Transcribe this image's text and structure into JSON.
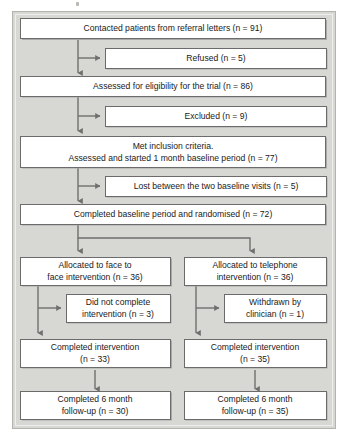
{
  "diagram": {
    "panel": {
      "background_color": "#d7d7d4",
      "border_color": "#b3b3b0"
    },
    "box_style": {
      "fill": "#ffffff",
      "border_color": "#6b6b6b",
      "shadow_color": "#a9a9a7"
    },
    "connector_color": "#6f6f6f",
    "nodes": [
      {
        "id": "contacted",
        "name": "contacted-patients-box",
        "lines": [
          "Contacted patients from referral letters (n = 91)"
        ],
        "n": 91,
        "column": "full"
      },
      {
        "id": "refused",
        "name": "refused-box",
        "lines": [
          "Refused (n = 5)"
        ],
        "n": 5,
        "column": "right-branch"
      },
      {
        "id": "assessed",
        "name": "assessed-eligibility-box",
        "lines": [
          "Assessed for eligibility for the trial (n = 86)"
        ],
        "n": 86,
        "column": "full"
      },
      {
        "id": "excluded",
        "name": "excluded-box",
        "lines": [
          "Excluded (n = 9)"
        ],
        "n": 9,
        "column": "right-branch"
      },
      {
        "id": "met-inclusion",
        "name": "met-inclusion-criteria-box",
        "lines": [
          "Met inclusion criteria.",
          "Assessed and started 1 month baseline period (n = 77)"
        ],
        "n": 77,
        "column": "full"
      },
      {
        "id": "lost-baseline",
        "name": "lost-between-baseline-visits-box",
        "lines": [
          "Lost between the two baseline visits (n = 5)"
        ],
        "n": 5,
        "column": "right-branch"
      },
      {
        "id": "randomised",
        "name": "completed-baseline-randomised-box",
        "lines": [
          "Completed baseline period and randomised (n = 72)"
        ],
        "n": 72,
        "column": "full"
      },
      {
        "id": "alloc-face",
        "name": "allocated-face-to-face-box",
        "lines": [
          "Allocated to face to",
          "face intervention (n = 36)"
        ],
        "n": 36,
        "column": "left"
      },
      {
        "id": "alloc-phone",
        "name": "allocated-telephone-box",
        "lines": [
          "Allocated to telephone",
          "intervention (n = 36)"
        ],
        "n": 36,
        "column": "right"
      },
      {
        "id": "did-not-complete",
        "name": "did-not-complete-intervention-box",
        "lines": [
          "Did not complete",
          "intervention (n = 3)"
        ],
        "n": 3,
        "column": "left-branch"
      },
      {
        "id": "withdrawn",
        "name": "withdrawn-by-clinician-box",
        "lines": [
          "Withdrawn by",
          "clinician (n = 1)"
        ],
        "n": 1,
        "column": "right-branch-lower"
      },
      {
        "id": "completed-left",
        "name": "completed-intervention-left-box",
        "lines": [
          "Completed intervention",
          "(n = 33)"
        ],
        "n": 33,
        "column": "left"
      },
      {
        "id": "completed-right",
        "name": "completed-intervention-right-box",
        "lines": [
          "Completed intervention",
          "(n = 35)"
        ],
        "n": 35,
        "column": "right"
      },
      {
        "id": "followup-left",
        "name": "completed-6-month-followup-left-box",
        "lines": [
          "Completed 6 month",
          "follow-up (n = 30)"
        ],
        "n": 30,
        "column": "left"
      },
      {
        "id": "followup-right",
        "name": "completed-6-month-followup-right-box",
        "lines": [
          "Completed 6 month",
          "follow-up (n = 35)"
        ],
        "n": 35,
        "column": "right"
      }
    ]
  }
}
